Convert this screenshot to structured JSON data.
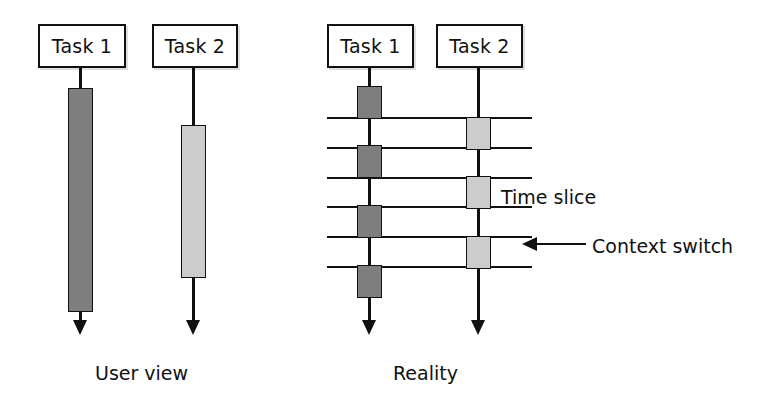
{
  "figure": {
    "type": "timeline-diagram",
    "colors": {
      "task1_block": "#7e7e7e",
      "task2_block": "#cccccc",
      "stroke": "#111111",
      "background": "#ffffff"
    }
  },
  "panels": [
    {
      "id": "user-view",
      "caption": "User view",
      "caption_pos": {
        "x": 95,
        "y": 362
      },
      "tasks": [
        {
          "id": "task1",
          "label": "Task 1",
          "box": {
            "x": 38,
            "y": 24,
            "w": 88,
            "h": 44
          },
          "axis": {
            "x": 80.5,
            "y": 68,
            "h": 252
          },
          "arrow_tip_y": 338,
          "blocks": [
            {
              "x": 68,
              "y": 88,
              "w": 25,
              "h": 224,
              "shade": "dark"
            }
          ]
        },
        {
          "id": "task2",
          "label": "Task 2",
          "box": {
            "x": 152,
            "y": 24,
            "w": 86,
            "h": 44
          },
          "axis": {
            "x": 193.5,
            "y": 68,
            "h": 252
          },
          "arrow_tip_y": 338,
          "blocks": [
            {
              "x": 181,
              "y": 125,
              "w": 25,
              "h": 153,
              "shade": "light"
            }
          ]
        }
      ]
    },
    {
      "id": "reality",
      "caption": "Reality",
      "caption_pos": {
        "x": 393,
        "y": 362
      },
      "tasks": [
        {
          "id": "task1",
          "label": "Task 1",
          "box": {
            "x": 327,
            "y": 24,
            "w": 87,
            "h": 44
          },
          "axis": {
            "x": 369.5,
            "y": 68,
            "h": 252
          },
          "arrow_tip_y": 338,
          "blocks": [
            {
              "x": 357,
              "y": 86,
              "w": 25,
              "h": 33,
              "shade": "dark"
            },
            {
              "x": 357,
              "y": 145,
              "w": 25,
              "h": 33,
              "shade": "dark"
            },
            {
              "x": 357,
              "y": 205,
              "w": 25,
              "h": 33,
              "shade": "dark"
            },
            {
              "x": 357,
              "y": 265,
              "w": 25,
              "h": 33,
              "shade": "dark"
            }
          ]
        },
        {
          "id": "task2",
          "label": "Task 2",
          "box": {
            "x": 436,
            "y": 24,
            "w": 87,
            "h": 44
          },
          "axis": {
            "x": 478.5,
            "y": 68,
            "h": 252
          },
          "arrow_tip_y": 338,
          "blocks": [
            {
              "x": 466,
              "y": 117,
              "w": 25,
              "h": 33,
              "shade": "light"
            },
            {
              "x": 466,
              "y": 176,
              "w": 25,
              "h": 33,
              "shade": "light"
            },
            {
              "x": 466,
              "y": 236,
              "w": 25,
              "h": 33,
              "shade": "light"
            }
          ]
        }
      ],
      "time_slice_lines": [
        {
          "x": 327,
          "y": 117,
          "w": 205
        },
        {
          "x": 327,
          "y": 147,
          "w": 205
        },
        {
          "x": 327,
          "y": 177,
          "w": 205
        },
        {
          "x": 327,
          "y": 206,
          "w": 205
        },
        {
          "x": 327,
          "y": 236,
          "w": 205
        },
        {
          "x": 327,
          "y": 266,
          "w": 205
        }
      ]
    }
  ],
  "annotations": [
    {
      "id": "time-slice",
      "label": "Time slice",
      "text_pos": {
        "x": 501,
        "y": 186
      }
    },
    {
      "id": "context-switch",
      "label": "Context switch",
      "text_pos": {
        "x": 592,
        "y": 235
      },
      "arrow": {
        "x": 530,
        "y": 243,
        "w": 56
      }
    }
  ]
}
